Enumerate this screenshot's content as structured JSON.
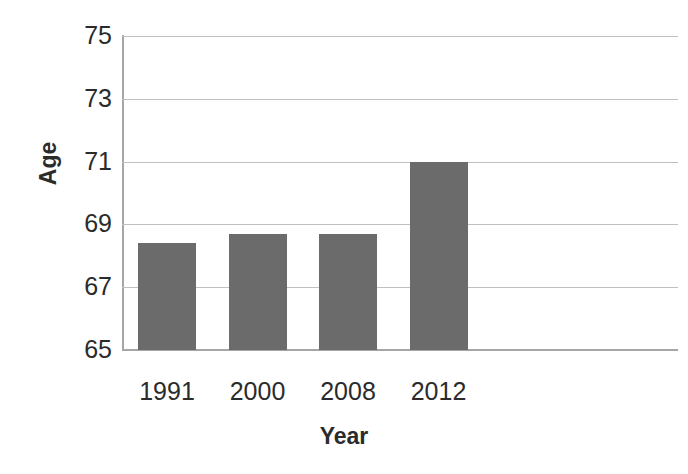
{
  "chart_data": {
    "type": "bar",
    "title": "",
    "subtitle": "",
    "xlabel": "Year",
    "ylabel": "Age",
    "categories": [
      "1991",
      "2000",
      "2008",
      "2012"
    ],
    "values": [
      68.4,
      68.7,
      68.7,
      71.0
    ],
    "series": [
      {
        "name": "Age",
        "values": [
          68.4,
          68.7,
          68.7,
          71.0
        ]
      }
    ],
    "ylim": [
      65,
      75
    ],
    "yticks": [
      65,
      67,
      69,
      71,
      73,
      75
    ],
    "ytick_labels": [
      "65",
      "67",
      "69",
      "71",
      "73",
      "75"
    ],
    "grid": "horizontal",
    "legend": "none",
    "bar_color": "#6b6b6b",
    "gridline_color": "#bfbfbf",
    "axis_color": "#a6a6a6",
    "background_color": "#ffffff",
    "annotations": []
  }
}
